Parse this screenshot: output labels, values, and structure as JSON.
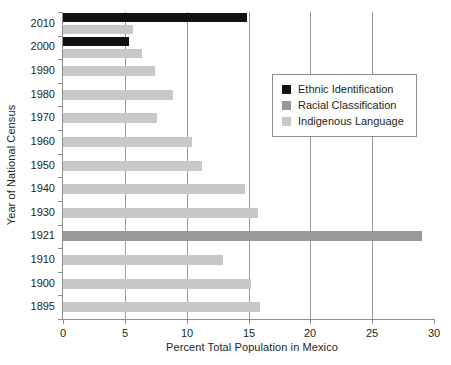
{
  "chart_data": {
    "type": "bar",
    "orientation": "horizontal",
    "title": "",
    "xlabel": "Percent Total Population in Mexico",
    "ylabel": "Year of National Census",
    "xlim": [
      0,
      30
    ],
    "xticks": [
      0,
      5,
      10,
      15,
      20,
      25,
      30
    ],
    "grid": "vertical",
    "legend_position": "upper right",
    "categories": [
      "2010",
      "2000",
      "1990",
      "1980",
      "1970",
      "1960",
      "1950",
      "1940",
      "1930",
      "1921",
      "1910",
      "1900",
      "1895"
    ],
    "series": [
      {
        "name": "Ethnic Identification",
        "color": "#111111",
        "values": [
          14.9,
          5.3,
          null,
          null,
          null,
          null,
          null,
          null,
          null,
          null,
          null,
          null,
          null
        ]
      },
      {
        "name": "Racial Classification",
        "color": "#999999",
        "values": [
          null,
          null,
          null,
          null,
          null,
          null,
          null,
          null,
          null,
          29.0,
          null,
          null,
          null
        ]
      },
      {
        "name": "Indigenous Language",
        "color": "#c8c8c8",
        "values": [
          5.7,
          6.4,
          7.4,
          8.9,
          7.6,
          10.4,
          11.2,
          14.7,
          15.8,
          null,
          12.9,
          15.2,
          15.9
        ]
      }
    ]
  },
  "legend": {
    "items": [
      {
        "label": "Ethnic Identification",
        "color": "#111111"
      },
      {
        "label": "Racial Classification",
        "color": "#999999"
      },
      {
        "label": "Indigenous Language",
        "color": "#c8c8c8"
      }
    ]
  },
  "axes": {
    "x_title": "Percent Total Population in Mexico",
    "y_title": "Year of National Census",
    "x_tick_labels": [
      "0",
      "5",
      "10",
      "15",
      "20",
      "25",
      "30"
    ],
    "y_tick_labels": [
      "2010",
      "2000",
      "1990",
      "1980",
      "1970",
      "1960",
      "1950",
      "1940",
      "1930",
      "1921",
      "1910",
      "1900",
      "1895"
    ]
  },
  "colors": {
    "axis": "#8d8d8d",
    "grid": "#9a9a9a",
    "text": "#231f20",
    "background": "#ffffff"
  }
}
